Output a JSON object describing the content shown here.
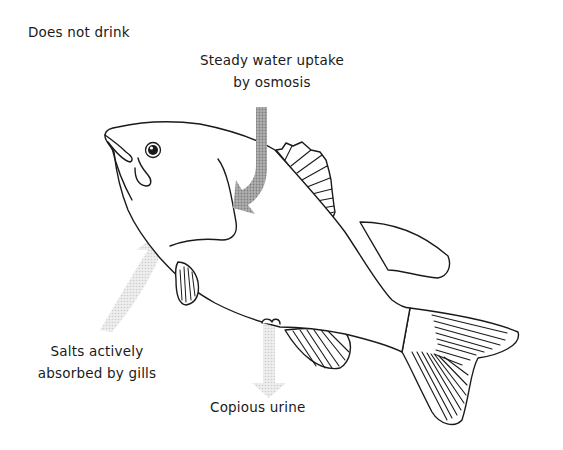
{
  "diagram": {
    "labels": {
      "does_not_drink": "Does not drink",
      "water_uptake": {
        "line1": "Steady water uptake",
        "line2": "by osmosis"
      },
      "salts": {
        "line1": "Salts actively",
        "line2": "absorbed by gills"
      },
      "urine": "Copious urine"
    },
    "arrows": [
      {
        "id": "water-uptake-arrow",
        "direction": "down-then-hook-left",
        "meaning": "water enters body"
      },
      {
        "id": "salt-uptake-arrow",
        "direction": "up-into-gills",
        "meaning": "salts absorbed"
      },
      {
        "id": "urine-arrow",
        "direction": "down",
        "meaning": "urine excreted"
      }
    ],
    "colors": {
      "outline": "#1a1a1a",
      "water_arrow": "#9a9a9a",
      "salt_arrow": "#d9d9d9",
      "urine_arrow": "#e3e3e3",
      "background": "#ffffff"
    }
  }
}
